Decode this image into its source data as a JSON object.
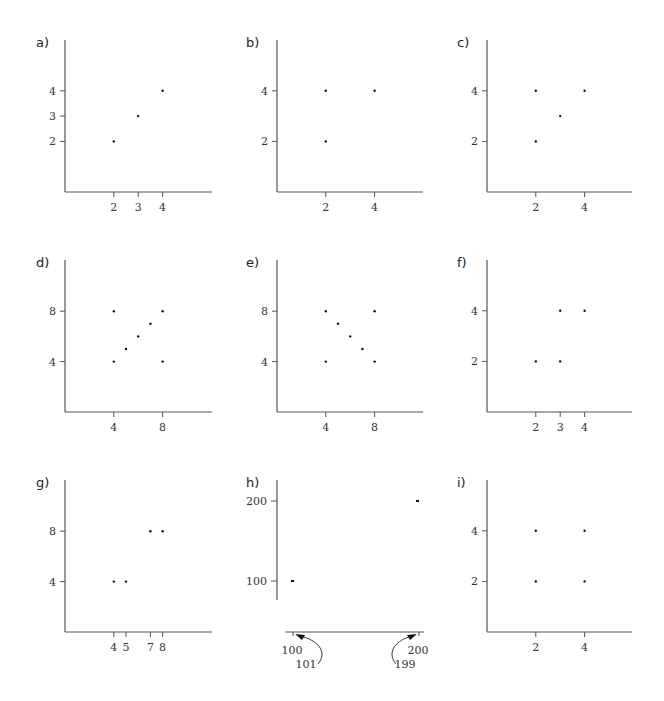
{
  "chart_data": [
    {
      "type": "scatter",
      "label": "a)",
      "x": [
        2,
        3,
        4
      ],
      "y": [
        2,
        3,
        4
      ],
      "xticks": [
        2,
        3,
        4
      ],
      "yticks": [
        2,
        3,
        4
      ],
      "xlim": [
        0,
        6
      ],
      "ylim": [
        0,
        6
      ],
      "grid": false
    },
    {
      "type": "scatter",
      "label": "b)",
      "x": [
        2,
        2,
        4
      ],
      "y": [
        2,
        4,
        4
      ],
      "xticks": [
        2,
        4
      ],
      "yticks": [
        2,
        4
      ],
      "xlim": [
        0,
        6
      ],
      "ylim": [
        0,
        6
      ],
      "grid": false
    },
    {
      "type": "scatter",
      "label": "c)",
      "x": [
        2,
        2,
        3,
        4
      ],
      "y": [
        2,
        4,
        3,
        4
      ],
      "xticks": [
        2,
        4
      ],
      "yticks": [
        2,
        4
      ],
      "xlim": [
        0,
        6
      ],
      "ylim": [
        0,
        6
      ],
      "grid": false
    },
    {
      "type": "scatter",
      "label": "d)",
      "x": [
        4,
        4,
        5,
        6,
        7,
        8,
        8
      ],
      "y": [
        4,
        8,
        5,
        6,
        7,
        8,
        4
      ],
      "xticks": [
        4,
        8
      ],
      "yticks": [
        4,
        8
      ],
      "xlim": [
        0,
        12
      ],
      "ylim": [
        0,
        12
      ],
      "grid": false
    },
    {
      "type": "scatter",
      "label": "e)",
      "x": [
        4,
        4,
        5,
        6,
        7,
        8,
        8
      ],
      "y": [
        4,
        8,
        7,
        6,
        5,
        8,
        4
      ],
      "xticks": [
        4,
        8
      ],
      "yticks": [
        4,
        8
      ],
      "xlim": [
        0,
        12
      ],
      "ylim": [
        0,
        12
      ],
      "grid": false
    },
    {
      "type": "scatter",
      "label": "f)",
      "x": [
        2,
        3,
        3,
        4
      ],
      "y": [
        2,
        2,
        4,
        4
      ],
      "xticks": [
        2,
        3,
        4
      ],
      "yticks": [
        2,
        4
      ],
      "xlim": [
        0,
        6
      ],
      "ylim": [
        0,
        6
      ],
      "grid": false
    },
    {
      "type": "scatter",
      "label": "g)",
      "x": [
        4,
        5,
        7,
        8
      ],
      "y": [
        4,
        4,
        8,
        8
      ],
      "xticks": [
        4,
        5,
        7,
        8
      ],
      "yticks": [
        4,
        8
      ],
      "xlim": [
        0,
        12
      ],
      "ylim": [
        0,
        12
      ],
      "grid": false
    },
    {
      "type": "scatter",
      "label": "h)",
      "x": [
        101,
        199
      ],
      "y": [
        100,
        200
      ],
      "xticks": [
        100,
        200
      ],
      "yticks": [
        100,
        200
      ],
      "annotations": [
        {
          "text": "101",
          "points_to_x": 101
        },
        {
          "text": "199",
          "points_to_x": 199
        }
      ],
      "xlim": [
        98,
        202
      ],
      "ylim": [
        80,
        220
      ],
      "grid": false,
      "note": "broken/detached axes"
    },
    {
      "type": "scatter",
      "label": "i)",
      "x": [
        2,
        2,
        4,
        4
      ],
      "y": [
        2,
        4,
        2,
        4
      ],
      "xticks": [
        2,
        4
      ],
      "yticks": [
        2,
        4
      ],
      "xlim": [
        0,
        6
      ],
      "ylim": [
        0,
        6
      ],
      "grid": false
    }
  ],
  "layout": {
    "panels": [
      {
        "ox": 65,
        "oy": 192,
        "top": 40,
        "right": 212,
        "sx": 24.4,
        "sy": 25.3
      },
      {
        "ox": 277,
        "oy": 192,
        "top": 40,
        "right": 423,
        "sx": 24.4,
        "sy": 25.3
      },
      {
        "ox": 487,
        "oy": 192,
        "top": 40,
        "right": 632,
        "sx": 24.4,
        "sy": 25.3
      },
      {
        "ox": 65,
        "oy": 412,
        "top": 260,
        "right": 212,
        "sx": 12.2,
        "sy": 12.6
      },
      {
        "ox": 277,
        "oy": 412,
        "top": 260,
        "right": 423,
        "sx": 12.2,
        "sy": 12.6
      },
      {
        "ox": 487,
        "oy": 412,
        "top": 260,
        "right": 632,
        "sx": 24.4,
        "sy": 25.3
      },
      {
        "ox": 65,
        "oy": 632,
        "top": 480,
        "right": 212,
        "sx": 12.2,
        "sy": 12.6
      }
    ]
  }
}
